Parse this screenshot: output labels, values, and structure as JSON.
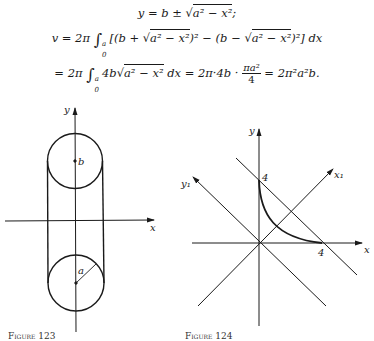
{
  "equations": {
    "line1": {
      "lhs": "y = b ± ",
      "radicand": "a² − x²",
      "tail": ";"
    },
    "line2": {
      "lhs": "v = 2π ",
      "integral_upper": "a",
      "integral_lower": "0",
      "body_a": "[(b + ",
      "radicand_a": "a² − x²",
      "body_b": ")² − (b − ",
      "radicand_b": "a² − x²",
      "body_c": ")²] dx"
    },
    "line3": {
      "lhs": "= 2π ",
      "integral_upper": "a",
      "integral_lower": "0",
      "coef": "4b",
      "radicand": "a² − x²",
      "mid": " dx = 2π·4b · ",
      "frac_num": "πa²",
      "frac_den": "4",
      "rhs": " = 2π²a²b."
    }
  },
  "figure_left": {
    "caption": "Figure 123",
    "labels": {
      "y_axis": "y",
      "x_axis": "x",
      "center": "b",
      "radius": "a"
    }
  },
  "figure_right": {
    "caption": "Figure 124",
    "labels": {
      "y_axis": "y",
      "x_axis": "x",
      "x1_axis": "x₁",
      "y1_axis": "y₁",
      "y_intercept": "4",
      "x_intercept": "4"
    }
  },
  "colors": {
    "ink": "#1a1a1a",
    "background": "#ffffff"
  }
}
